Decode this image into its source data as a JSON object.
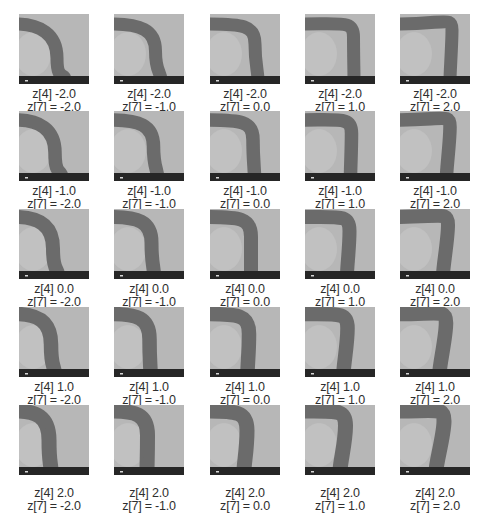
{
  "figure": {
    "type": "latent-traversal-grid",
    "rows": 5,
    "cols": 5,
    "row_variable": "z[4]",
    "col_variable": "z[7]",
    "row_values": [
      "-2.0",
      "-1.0",
      "0.0",
      "1.0",
      "2.0"
    ],
    "col_values": [
      "-2.0",
      "-1.0",
      "0.0",
      "1.0",
      "2.0"
    ],
    "colors": {
      "tile_background": "#b7b7b7",
      "band": "#646464",
      "bottom_strip": "#262626",
      "label_text": "#2e2e2e"
    },
    "cells": [
      [
        {
          "line1": "z[4] -2.0",
          "line2": "z[7] = -2.0"
        },
        {
          "line1": "z[4] -2.0",
          "line2": "z[7] = -1.0"
        },
        {
          "line1": "z[4] -2.0",
          "line2": "z[7] = 0.0"
        },
        {
          "line1": "z[4] -2.0",
          "line2": "z[7] = 1.0"
        },
        {
          "line1": "z[4] -2.0",
          "line2": "z[7] = 2.0"
        }
      ],
      [
        {
          "line1": "z[4] -1.0",
          "line2": "z[7] = -2.0"
        },
        {
          "line1": "z[4] -1.0",
          "line2": "z[7] = -1.0"
        },
        {
          "line1": "z[4] -1.0",
          "line2": "z[7] = 0.0"
        },
        {
          "line1": "z[4] -1.0",
          "line2": "z[7] = 1.0"
        },
        {
          "line1": "z[4] -1.0",
          "line2": "z[7] = 2.0"
        }
      ],
      [
        {
          "line1": "z[4] 0.0",
          "line2": "z[7] = -2.0"
        },
        {
          "line1": "z[4] 0.0",
          "line2": "z[7] = -1.0"
        },
        {
          "line1": "z[4] 0.0",
          "line2": "z[7] = 0.0"
        },
        {
          "line1": "z[4] 0.0",
          "line2": "z[7] = 1.0"
        },
        {
          "line1": "z[4] 0.0",
          "line2": "z[7] = 2.0"
        }
      ],
      [
        {
          "line1": "z[4] 1.0",
          "line2": "z[7] = -2.0"
        },
        {
          "line1": "z[4] 1.0",
          "line2": "z[7] = -1.0"
        },
        {
          "line1": "z[4] 1.0",
          "line2": "z[7] = 0.0"
        },
        {
          "line1": "z[4] 1.0",
          "line2": "z[7] = 1.0"
        },
        {
          "line1": "z[4] 1.0",
          "line2": "z[7] = 2.0"
        }
      ],
      [
        {
          "line1": "z[4] 2.0",
          "line2": "z[7] = -2.0"
        },
        {
          "line1": "z[4] 2.0",
          "line2": "z[7] = -1.0"
        },
        {
          "line1": "z[4] 2.0",
          "line2": "z[7] = 0.0"
        },
        {
          "line1": "z[4] 2.0",
          "line2": "z[7] = 1.0"
        },
        {
          "line1": "z[4] 2.0",
          "line2": "z[7] = 2.0"
        }
      ]
    ]
  }
}
